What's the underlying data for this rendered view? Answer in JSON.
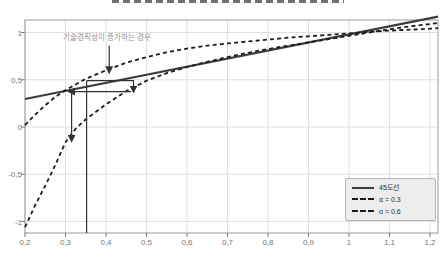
{
  "figure": {
    "cropped_title_visible": true
  },
  "chart_data": {
    "type": "line",
    "xlim": [
      0.2,
      1.22
    ],
    "ylim": [
      -1.12,
      1.13
    ],
    "grid": true,
    "legend_position": "bottom-right",
    "x_ticks": {
      "values": [
        0.2,
        0.3,
        0.4,
        0.5,
        0.6,
        0.7,
        0.8,
        0.9,
        1.0,
        1.1,
        1.2
      ],
      "labels": [
        "0,2",
        "0,3",
        "0,4",
        "0,5",
        "0,6",
        "0,7",
        "0,8",
        "0,9",
        "1",
        "1,1",
        "1,2"
      ]
    },
    "y_ticks": {
      "values": [
        1.0,
        0.5,
        0.0,
        -0.5,
        -1.0
      ],
      "labels": [
        "1",
        "0,5",
        "0",
        "-0,5",
        "-1"
      ]
    },
    "series": [
      {
        "name": "45도선",
        "style": "solid",
        "color": "#3d3d3d",
        "width": 2.2,
        "x": [
          0.2,
          1.22
        ],
        "y": [
          0.296,
          1.168
        ]
      },
      {
        "name": "α = 0.3",
        "style": "dashed",
        "color": "#1d1d1d",
        "width": 1.8,
        "x": [
          0.2,
          0.225,
          0.25,
          0.275,
          0.3,
          0.35,
          0.4,
          0.45,
          0.5,
          0.55,
          0.6,
          0.65,
          0.7,
          0.75,
          0.8,
          0.85,
          0.9,
          0.95,
          1.0,
          1.05,
          1.1,
          1.15,
          1.2,
          1.22
        ],
        "y": [
          0.02,
          0.13,
          0.23,
          0.32,
          0.39,
          0.51,
          0.6,
          0.68,
          0.74,
          0.79,
          0.83,
          0.86,
          0.885,
          0.905,
          0.925,
          0.945,
          0.96,
          0.975,
          0.99,
          1.005,
          1.02,
          1.03,
          1.04,
          1.045
        ]
      },
      {
        "name": "α = 0.6",
        "style": "dashed",
        "color": "#1d1d1d",
        "width": 1.8,
        "x": [
          0.2,
          0.225,
          0.25,
          0.275,
          0.3,
          0.325,
          0.35,
          0.4,
          0.45,
          0.5,
          0.55,
          0.6,
          0.65,
          0.7,
          0.75,
          0.8,
          0.85,
          0.9,
          0.95,
          1.0,
          1.05,
          1.1,
          1.15,
          1.2,
          1.22
        ],
        "y": [
          -1.06,
          -0.83,
          -0.62,
          -0.4,
          -0.16,
          -0.02,
          0.08,
          0.24,
          0.38,
          0.49,
          0.57,
          0.635,
          0.69,
          0.74,
          0.785,
          0.825,
          0.86,
          0.895,
          0.93,
          0.965,
          1.0,
          1.035,
          1.065,
          1.09,
          1.1
        ]
      }
    ],
    "annotation": {
      "text": "기술경직성이 증가하는 경우",
      "arrow": {
        "points": [
          [
            0.408,
            0.86
          ],
          [
            0.408,
            0.575
          ]
        ]
      }
    },
    "guides": [
      {
        "name": "equilibrium-dropline",
        "points": [
          [
            0.352,
            -1.122
          ],
          [
            0.352,
            0.49
          ]
        ],
        "arrow": false
      },
      {
        "name": "shift-step-right-down",
        "points": [
          [
            0.352,
            0.49
          ],
          [
            0.468,
            0.49
          ],
          [
            0.468,
            0.37
          ]
        ],
        "arrow": true
      },
      {
        "name": "shift-left-arrow",
        "points": [
          [
            0.462,
            0.375
          ],
          [
            0.308,
            0.375
          ]
        ],
        "arrow": true
      },
      {
        "name": "drop-to-new-curve-arrow",
        "points": [
          [
            0.315,
            0.365
          ],
          [
            0.315,
            -0.15
          ]
        ],
        "arrow": true
      }
    ]
  },
  "legend": {
    "items": [
      {
        "label": "45도선",
        "style": "solid"
      },
      {
        "label": "α = 0.3",
        "style": "dashed"
      },
      {
        "label": "α = 0.6",
        "style": "dashed"
      }
    ]
  },
  "colors": {
    "grid": "#e0e0e0",
    "axis_border": "#999999",
    "tick": "#777777",
    "tick_label": "#777777",
    "guide_arrow": "#333333",
    "annotation_text": "#8f8f8f",
    "legend_bg": "#ededed",
    "legend_border": "#b5b5b5"
  }
}
